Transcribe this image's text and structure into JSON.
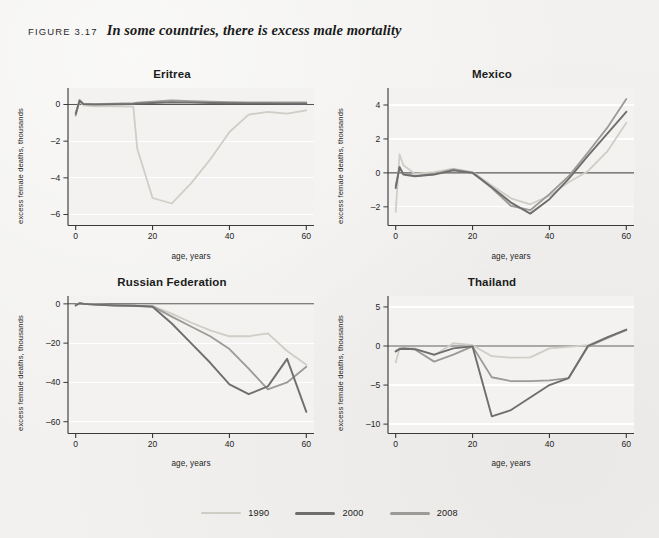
{
  "figure": {
    "kicker": "FIGURE 3.17",
    "title": "In some countries, there is excess male mortality",
    "page_background": "#f2f1ef",
    "plot_background": "#f3f2f0"
  },
  "legend": {
    "position": "bottom-center",
    "items": [
      {
        "label": "1990",
        "color": "#cfcdc6"
      },
      {
        "label": "2000",
        "color": "#6e6e6e"
      },
      {
        "label": "2008",
        "color": "#9a9a97"
      }
    ]
  },
  "axes": {
    "xlabel": "age, years",
    "ylabel": "excess female deaths, thousands",
    "xticks": [
      0,
      20,
      40,
      60
    ],
    "xlim": [
      -2,
      62
    ]
  },
  "chart_data": [
    {
      "type": "line",
      "title": "Eritrea",
      "xlabel": "age, years",
      "ylabel": "excess female deaths, thousands",
      "xlim": [
        -2,
        62
      ],
      "ylim": [
        -6.6,
        0.9
      ],
      "yticks": [
        0,
        -2,
        -4,
        -6
      ],
      "grid": true,
      "x": [
        0,
        1,
        2,
        5,
        10,
        15,
        16,
        20,
        25,
        30,
        35,
        40,
        45,
        50,
        55,
        60
      ],
      "series": [
        {
          "name": "1990",
          "color": "#cfcdc6",
          "values": [
            -0.45,
            0.15,
            -0.05,
            -0.1,
            -0.1,
            -0.12,
            -2.4,
            -5.1,
            -5.4,
            -4.3,
            -3.0,
            -1.5,
            -0.55,
            -0.4,
            -0.5,
            -0.32
          ]
        },
        {
          "name": "2000",
          "color": "#6e6e6e",
          "values": [
            -0.5,
            0.2,
            0.02,
            0.0,
            0.01,
            0.03,
            0.05,
            0.08,
            0.12,
            0.1,
            0.08,
            0.07,
            0.06,
            0.06,
            0.05,
            0.05
          ]
        },
        {
          "name": "2008",
          "color": "#9a9a97",
          "values": [
            -0.6,
            0.25,
            0.05,
            0.02,
            0.04,
            0.08,
            0.1,
            0.16,
            0.22,
            0.18,
            0.15,
            0.13,
            0.12,
            0.12,
            0.12,
            0.12
          ]
        }
      ]
    },
    {
      "type": "line",
      "title": "Mexico",
      "xlabel": "age, years",
      "ylabel": "excess female deaths, thousands",
      "xlim": [
        -2,
        62
      ],
      "ylim": [
        -3.1,
        5.0
      ],
      "yticks": [
        4,
        2,
        0,
        -2
      ],
      "grid": true,
      "x": [
        0,
        1,
        2,
        5,
        10,
        15,
        20,
        25,
        30,
        35,
        40,
        45,
        50,
        55,
        60
      ],
      "series": [
        {
          "name": "1990",
          "color": "#cfcdc6",
          "values": [
            -2.3,
            1.1,
            0.45,
            -0.05,
            0.05,
            0.25,
            0.05,
            -0.75,
            -1.5,
            -1.85,
            -1.35,
            -0.55,
            0.1,
            1.25,
            2.95
          ]
        },
        {
          "name": "2000",
          "color": "#6e6e6e",
          "values": [
            -0.9,
            0.35,
            -0.1,
            -0.2,
            -0.1,
            0.15,
            0.0,
            -0.85,
            -1.75,
            -2.4,
            -1.55,
            -0.35,
            1.0,
            2.3,
            3.6
          ]
        },
        {
          "name": "2008",
          "color": "#9a9a97",
          "values": [
            -0.75,
            0.3,
            -0.05,
            -0.18,
            -0.08,
            0.2,
            0.02,
            -0.9,
            -1.95,
            -2.2,
            -1.25,
            -0.2,
            1.2,
            2.65,
            4.35
          ]
        }
      ]
    },
    {
      "type": "line",
      "title": "Russian Federation",
      "xlabel": "age, years",
      "ylabel": "excess female deaths, thousands",
      "xlim": [
        -2,
        62
      ],
      "ylim": [
        -66,
        4
      ],
      "yticks": [
        0,
        -20,
        -40,
        -60
      ],
      "grid": true,
      "x": [
        0,
        1,
        2,
        5,
        10,
        15,
        20,
        25,
        30,
        35,
        40,
        45,
        50,
        55,
        60
      ],
      "series": [
        {
          "name": "1990",
          "color": "#cfcdc6",
          "values": [
            -0.6,
            0.4,
            0.1,
            -0.3,
            -0.6,
            -0.9,
            -1.2,
            -5.0,
            -9.5,
            -13.5,
            -16.5,
            -16.5,
            -15.0,
            -24.0,
            -31.0
          ]
        },
        {
          "name": "2000",
          "color": "#6e6e6e",
          "values": [
            -0.8,
            0.3,
            0.0,
            -0.4,
            -0.8,
            -1.0,
            -1.5,
            -10.0,
            -20.0,
            -30.0,
            -41.0,
            -46.0,
            -42.0,
            -28.0,
            -55.0
          ]
        },
        {
          "name": "2008",
          "color": "#9a9a97",
          "values": [
            -0.7,
            0.35,
            0.05,
            -0.35,
            -0.7,
            -0.95,
            -1.3,
            -6.5,
            -11.5,
            -16.5,
            -23.0,
            -33.0,
            -43.5,
            -40.0,
            -32.0
          ]
        }
      ]
    },
    {
      "type": "line",
      "title": "Thailand",
      "xlabel": "age, years",
      "ylabel": "excess female deaths, thousands",
      "xlim": [
        -2,
        62
      ],
      "ylim": [
        -11.2,
        6.4
      ],
      "yticks": [
        5,
        0,
        -5,
        -10
      ],
      "grid": true,
      "x": [
        0,
        1,
        2,
        5,
        10,
        15,
        20,
        25,
        30,
        35,
        40,
        45,
        50,
        55,
        60
      ],
      "series": [
        {
          "name": "1990",
          "color": "#cfcdc6",
          "values": [
            -2.1,
            -0.3,
            -0.25,
            -0.3,
            -1.2,
            0.35,
            0.1,
            -1.3,
            -1.5,
            -1.45,
            -0.3,
            -0.1,
            0.1,
            1.1,
            2.0
          ]
        },
        {
          "name": "2000",
          "color": "#6e6e6e",
          "values": [
            -0.7,
            -0.4,
            -0.35,
            -0.4,
            -1.1,
            -0.3,
            -0.05,
            -9.0,
            -8.2,
            -6.6,
            -5.0,
            -4.1,
            0.0,
            1.1,
            2.1
          ]
        },
        {
          "name": "2008",
          "color": "#9a9a97",
          "values": [
            -0.65,
            -0.35,
            -0.3,
            -0.45,
            -2.0,
            -1.1,
            -0.05,
            -4.0,
            -4.5,
            -4.5,
            -4.4,
            -4.1,
            -0.1,
            1.0,
            2.05
          ]
        }
      ]
    }
  ]
}
